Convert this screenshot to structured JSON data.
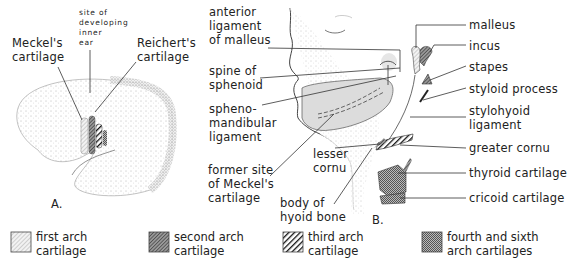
{
  "figure": {
    "panel_a": {
      "panel_label": "A.",
      "labels": {
        "meckels": [
          "Meckel's",
          "cartilage"
        ],
        "inner_ear": [
          "site of",
          "developing",
          "inner",
          "ear"
        ],
        "reicherts": [
          "Reichert's",
          "cartilage"
        ]
      }
    },
    "panel_b": {
      "panel_label": "B.",
      "left_labels": {
        "anterior_ligament": [
          "anterior",
          "ligament",
          "of malleus"
        ],
        "spine_sphenoid": [
          "spine of",
          "sphenoid"
        ],
        "sphenomandibular": [
          "spheno-",
          "mandibular",
          "ligament"
        ],
        "former_meckel": [
          "former site",
          "of Meckel's",
          "cartilage"
        ],
        "lesser_cornu": [
          "lesser",
          "cornu"
        ],
        "body_hyoid": [
          "body of",
          "hyoid bone"
        ]
      },
      "right_labels": {
        "malleus": "malleus",
        "incus": "incus",
        "stapes": "stapes",
        "styloid": "styloid process",
        "stylohyoid": [
          "stylohyoid",
          "ligament"
        ],
        "greater_cornu": "greater cornu",
        "thyroid": "thyroid cartilage",
        "cricoid": "cricoid cartilage"
      }
    },
    "legend": [
      {
        "label": [
          "first arch",
          "cartilage"
        ],
        "pattern": "light-diagonal"
      },
      {
        "label": [
          "second arch",
          "cartilage"
        ],
        "pattern": "dark-diagonal"
      },
      {
        "label": [
          "third arch",
          "cartilage"
        ],
        "pattern": "black-bold-diagonal"
      },
      {
        "label": [
          "fourth and sixth",
          "arch cartilages"
        ],
        "pattern": "crosshatch"
      }
    ],
    "colors": {
      "ink": "#222222",
      "first_arch": "#d9d9d9",
      "second_arch": "#6b6b6b",
      "third_arch": "#111111",
      "fourth_sixth": "#8a8a8a",
      "ligament_fill": "#dcdcdc"
    }
  }
}
